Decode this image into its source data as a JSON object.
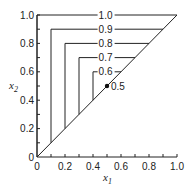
{
  "figure": {
    "x_axis": {
      "label": "x",
      "subscript": "1",
      "ticks": [
        "0",
        "0.2",
        "0.4",
        "0.6",
        "0.8",
        "1.0"
      ],
      "range": [
        0,
        1.0
      ]
    },
    "y_axis": {
      "label": "x",
      "subscript": "2",
      "ticks": [
        "0",
        "0.2",
        "0.4",
        "0.6",
        "0.8",
        "1.0"
      ],
      "range": [
        0,
        1.0
      ]
    },
    "contours": [
      {
        "level": 1.0,
        "label": "1.0",
        "x": 0.0
      },
      {
        "level": 0.9,
        "label": "0.9",
        "x": 0.1
      },
      {
        "level": 0.8,
        "label": "0.8",
        "x": 0.2
      },
      {
        "level": 0.7,
        "label": "0.7",
        "x": 0.3
      },
      {
        "level": 0.6,
        "label": "0.6",
        "x": 0.4
      }
    ],
    "point": {
      "x": 0.5,
      "y": 0.5,
      "label": "0.5"
    },
    "diagonal": {
      "from": [
        0,
        0
      ],
      "to": [
        1,
        1
      ]
    }
  }
}
